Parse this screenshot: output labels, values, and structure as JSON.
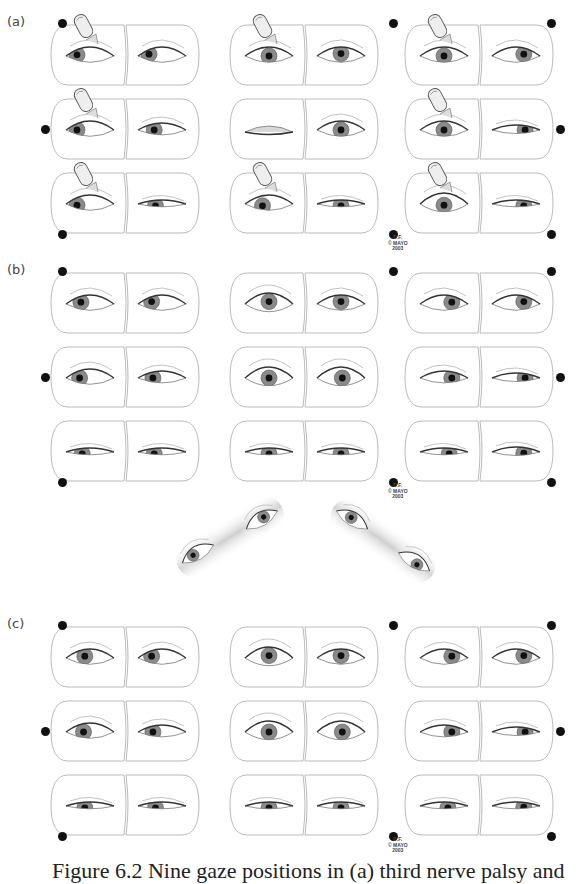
{
  "figure": {
    "sections": [
      {
        "label": "(a)",
        "top": 14,
        "finger_on_left_eye": true,
        "rows": [
          [
            {
              "left": {
                "gaze": [
                  -1,
                  -0.2
                ],
                "lid": "open",
                "finger": true
              },
              "right": {
                "gaze": [
                  -1,
                  -0.3
                ],
                "lid": "open"
              },
              "dot": "tl"
            },
            {
              "left": {
                "gaze": [
                  0,
                  0
                ],
                "lid": "open",
                "finger": true
              },
              "right": {
                "gaze": [
                  0,
                  -0.4
                ],
                "lid": "open"
              },
              "dot": "tm"
            },
            {
              "left": {
                "gaze": [
                  0,
                  0
                ],
                "lid": "open",
                "finger": true
              },
              "right": {
                "gaze": [
                  0.6,
                  -0.3
                ],
                "lid": "open"
              },
              "dot": "tr"
            }
          ],
          [
            {
              "left": {
                "gaze": [
                  -1,
                  0
                ],
                "lid": "open",
                "finger": true
              },
              "right": {
                "gaze": [
                  -0.6,
                  0
                ],
                "lid": "droop"
              },
              "dot": "ml"
            },
            {
              "left": {
                "gaze": [
                  0,
                  0
                ],
                "lid": "closed"
              },
              "right": {
                "gaze": [
                  0,
                  0
                ],
                "lid": "open"
              },
              "dot": null
            },
            {
              "left": {
                "gaze": [
                  0,
                  0
                ],
                "lid": "open",
                "finger": true
              },
              "right": {
                "gaze": [
                  0.7,
                  0
                ],
                "lid": "narrow"
              },
              "dot": "mr"
            }
          ],
          [
            {
              "left": {
                "gaze": [
                  -1,
                  0.2
                ],
                "lid": "open",
                "finger": true
              },
              "right": {
                "gaze": [
                  -0.5,
                  0.3
                ],
                "lid": "low"
              },
              "dot": "bl"
            },
            {
              "left": {
                "gaze": [
                  -0.5,
                  0.3
                ],
                "lid": "open",
                "finger": true
              },
              "right": {
                "gaze": [
                  0,
                  0.3
                ],
                "lid": "low"
              },
              "dot": "bm"
            },
            {
              "left": {
                "gaze": [
                  0,
                  0.2
                ],
                "lid": "wide",
                "finger": true
              },
              "right": {
                "gaze": [
                  0.6,
                  0.3
                ],
                "lid": "low"
              },
              "dot": "br"
            }
          ]
        ],
        "credit": [
          "D.F.",
          "© MAYO",
          "2003"
        ]
      },
      {
        "label": "(b)",
        "top": 262,
        "rows": [
          [
            {
              "left": {
                "gaze": [
                  -0.7,
                  -0.3
                ],
                "lid": "open"
              },
              "right": {
                "gaze": [
                  -0.8,
                  -0.4
                ],
                "lid": "open"
              },
              "dot": "tl"
            },
            {
              "left": {
                "gaze": [
                  0,
                  -0.4
                ],
                "lid": "wide"
              },
              "right": {
                "gaze": [
                  0,
                  -0.4
                ],
                "lid": "open"
              },
              "dot": "tm"
            },
            {
              "left": {
                "gaze": [
                  0.6,
                  -0.3
                ],
                "lid": "open"
              },
              "right": {
                "gaze": [
                  0.6,
                  -0.4
                ],
                "lid": "open"
              },
              "dot": "tr"
            }
          ],
          [
            {
              "left": {
                "gaze": [
                  -0.8,
                  0
                ],
                "lid": "open"
              },
              "right": {
                "gaze": [
                  -0.7,
                  0
                ],
                "lid": "droop"
              },
              "dot": "ml"
            },
            {
              "left": {
                "gaze": [
                  0,
                  0
                ],
                "lid": "wide"
              },
              "right": {
                "gaze": [
                  0.1,
                  0
                ],
                "lid": "wide"
              },
              "dot": null
            },
            {
              "left": {
                "gaze": [
                  0.6,
                  0
                ],
                "lid": "droop"
              },
              "right": {
                "gaze": [
                  0.7,
                  0
                ],
                "lid": "narrow"
              },
              "dot": "mr"
            }
          ],
          [
            {
              "left": {
                "gaze": [
                  -0.6,
                  0.3
                ],
                "lid": "low"
              },
              "right": {
                "gaze": [
                  -0.6,
                  0.3
                ],
                "lid": "low"
              },
              "dot": "bl"
            },
            {
              "left": {
                "gaze": [
                  0,
                  0.3
                ],
                "lid": "low"
              },
              "right": {
                "gaze": [
                  0,
                  0.3
                ],
                "lid": "low"
              },
              "dot": "bm"
            },
            {
              "left": {
                "gaze": [
                  0.4,
                  0.3
                ],
                "lid": "low"
              },
              "right": {
                "gaze": [
                  0.6,
                  0.2
                ],
                "lid": "narrow"
              },
              "dot": "br"
            }
          ]
        ],
        "credit": [
          "D.F.",
          "© MAYO",
          "2003"
        ]
      },
      {
        "label": "(c)",
        "top": 616,
        "rows": [
          [
            {
              "left": {
                "gaze": [
                  -0.4,
                  -0.3
                ],
                "lid": "open"
              },
              "right": {
                "gaze": [
                  -0.8,
                  -0.3
                ],
                "lid": "open"
              },
              "dot": "tl"
            },
            {
              "left": {
                "gaze": [
                  0,
                  -0.4
                ],
                "lid": "wide"
              },
              "right": {
                "gaze": [
                  0,
                  -0.4
                ],
                "lid": "open"
              },
              "dot": "tm"
            },
            {
              "left": {
                "gaze": [
                  0.6,
                  -0.3
                ],
                "lid": "open"
              },
              "right": {
                "gaze": [
                  0.6,
                  -0.4
                ],
                "lid": "open"
              },
              "dot": "tr"
            }
          ],
          [
            {
              "left": {
                "gaze": [
                  -0.5,
                  0
                ],
                "lid": "open"
              },
              "right": {
                "gaze": [
                  -0.7,
                  0
                ],
                "lid": "droop"
              },
              "dot": "ml"
            },
            {
              "left": {
                "gaze": [
                  0,
                  0
                ],
                "lid": "wide"
              },
              "right": {
                "gaze": [
                  0.1,
                  0
                ],
                "lid": "wide"
              },
              "dot": null
            },
            {
              "left": {
                "gaze": [
                  0.6,
                  0
                ],
                "lid": "droop"
              },
              "right": {
                "gaze": [
                  0.7,
                  0
                ],
                "lid": "narrow"
              },
              "dot": "mr"
            }
          ],
          [
            {
              "left": {
                "gaze": [
                  -0.4,
                  0.3
                ],
                "lid": "low"
              },
              "right": {
                "gaze": [
                  -0.5,
                  0.3
                ],
                "lid": "low"
              },
              "dot": "bl"
            },
            {
              "left": {
                "gaze": [
                  0,
                  0.3
                ],
                "lid": "low"
              },
              "right": {
                "gaze": [
                  0,
                  0.3
                ],
                "lid": "low"
              },
              "dot": "bm"
            },
            {
              "left": {
                "gaze": [
                  0.3,
                  0.3
                ],
                "lid": "low"
              },
              "right": {
                "gaze": [
                  0.6,
                  0.2
                ],
                "lid": "low"
              },
              "dot": "br"
            }
          ]
        ],
        "credit": [
          "D.F.",
          "© MAYO",
          "2003"
        ]
      }
    ],
    "diagonal_eyes": [
      {
        "x": 198,
        "y": 554,
        "gaze": [
          -0.5,
          -0.3
        ],
        "band": "left"
      },
      {
        "x": 262,
        "y": 520,
        "gaze": [
          0.3,
          -0.4
        ],
        "band": "left"
      },
      {
        "x": 352,
        "y": 520,
        "gaze": [
          -0.2,
          -0.4
        ],
        "band": "right"
      },
      {
        "x": 414,
        "y": 562,
        "gaze": [
          0.4,
          0.2
        ],
        "band": "right"
      }
    ],
    "caption": "Figure 6.2  Nine gaze positions in (a) third nerve palsy and"
  }
}
